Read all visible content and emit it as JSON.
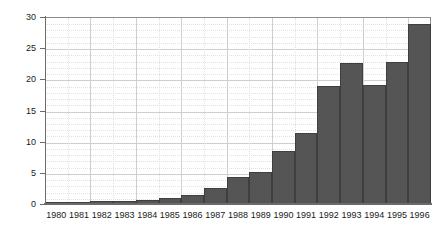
{
  "chart_data": {
    "type": "bar",
    "title": "",
    "subtitle": "",
    "xlabel": "",
    "ylabel": "",
    "categories": [
      "1980",
      "1981",
      "1982",
      "1983",
      "1984",
      "1985",
      "1986",
      "1987",
      "1988",
      "1989",
      "1990",
      "1991",
      "1992",
      "1993",
      "1994",
      "1995",
      "1996"
    ],
    "values": [
      0.3,
      0.3,
      0.5,
      0.5,
      0.7,
      1.0,
      1.4,
      2.6,
      4.3,
      5.2,
      8.5,
      11.4,
      19.0,
      22.6,
      19.1,
      22.8,
      28.8
    ],
    "series": [
      {
        "name": "",
        "values": [
          0.3,
          0.3,
          0.5,
          0.5,
          0.7,
          1.0,
          1.4,
          2.6,
          4.3,
          5.2,
          8.5,
          11.4,
          19.0,
          22.6,
          19.1,
          22.8,
          28.8
        ]
      }
    ],
    "ylim": [
      0,
      30
    ],
    "y_ticks": [
      0,
      5,
      10,
      15,
      20,
      25,
      30
    ],
    "y_tick_labels": [
      "0",
      "5",
      "10",
      "15",
      "20",
      "25",
      "30"
    ],
    "x_tick_labels": [
      "1980",
      "1981",
      "1982",
      "1983",
      "1984",
      "1985",
      "1986",
      "1987",
      "1988",
      "1989",
      "1990",
      "1991",
      "1992",
      "1993",
      "1994",
      "1995",
      "1996"
    ],
    "grid": true,
    "grid_minor": true,
    "legend": false,
    "legend_position": "none",
    "bar_gap": 0,
    "colors": {
      "bar_fill": "#555555",
      "bar_edge": "#3f3f3f",
      "grid_major": "#cfcfcf",
      "grid_minor": "#e2e2e2",
      "axis": "#6b6b6b",
      "plot_border": "#8a8a8a",
      "text": "#1a1a1a",
      "background": "#ffffff"
    }
  }
}
